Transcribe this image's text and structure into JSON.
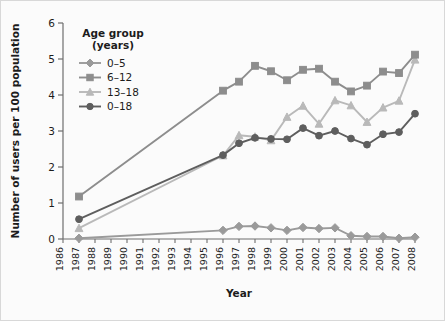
{
  "chart_data": {
    "type": "line",
    "title": "",
    "xlabel": "Year",
    "ylabel": "Number of users per 100 population",
    "xlim": [
      1986,
      2008
    ],
    "ylim": [
      0,
      6
    ],
    "yticks": [
      0,
      1,
      2,
      3,
      4,
      5,
      6
    ],
    "grid": false,
    "legend_position": "upper-left",
    "legend_title_line1": "Age group",
    "legend_title_line2": "(years)",
    "x": [
      1986,
      1987,
      1988,
      1989,
      1990,
      1991,
      1992,
      1993,
      1994,
      1995,
      1996,
      1997,
      1998,
      1999,
      2000,
      2001,
      2002,
      2003,
      2004,
      2005,
      2006,
      2007,
      2008
    ],
    "categories": [
      "1986",
      "1987",
      "1988",
      "1989",
      "1990",
      "1991",
      "1992",
      "1993",
      "1994",
      "1995",
      "1996",
      "1997",
      "1998",
      "1999",
      "2000",
      "2001",
      "2002",
      "2003",
      "2004",
      "2005",
      "2006",
      "2007",
      "2008"
    ],
    "series": [
      {
        "name": "0–5",
        "marker": "diamond",
        "color": "#9a9a9a",
        "x": [
          1987,
          1996,
          1997,
          1998,
          1999,
          2000,
          2001,
          2002,
          2003,
          2004,
          2005,
          2006,
          2007,
          2008
        ],
        "values": [
          0.02,
          0.24,
          0.35,
          0.36,
          0.31,
          0.24,
          0.32,
          0.29,
          0.31,
          0.09,
          0.07,
          0.07,
          0.02,
          0.05
        ]
      },
      {
        "name": "6–12",
        "marker": "square",
        "color": "#8d8d8d",
        "x": [
          1987,
          1996,
          1997,
          1998,
          1999,
          2000,
          2001,
          2002,
          2003,
          2004,
          2005,
          2006,
          2007,
          2008
        ],
        "values": [
          1.18,
          4.12,
          4.37,
          4.81,
          4.66,
          4.41,
          4.7,
          4.73,
          4.37,
          4.1,
          4.26,
          4.65,
          4.61,
          5.12
        ]
      },
      {
        "name": "13–18",
        "marker": "triangle",
        "color": "#b9b9b9",
        "x": [
          1987,
          1996,
          1997,
          1998,
          1999,
          2000,
          2001,
          2002,
          2003,
          2004,
          2005,
          2006,
          2007,
          2008
        ],
        "values": [
          0.3,
          2.32,
          2.88,
          2.84,
          2.74,
          3.39,
          3.7,
          3.2,
          3.85,
          3.71,
          3.25,
          3.65,
          3.84,
          4.98
        ]
      },
      {
        "name": "0–18",
        "marker": "circle",
        "color": "#5e5e5e",
        "x": [
          1987,
          1996,
          1997,
          1998,
          1999,
          2000,
          2001,
          2002,
          2003,
          2004,
          2005,
          2006,
          2007,
          2008
        ],
        "values": [
          0.55,
          2.33,
          2.66,
          2.81,
          2.78,
          2.77,
          3.08,
          2.87,
          3.0,
          2.79,
          2.62,
          2.91,
          2.97,
          3.48
        ]
      }
    ]
  },
  "axes": {
    "y_title": "Number of users per 100 population",
    "x_title": "Year"
  }
}
